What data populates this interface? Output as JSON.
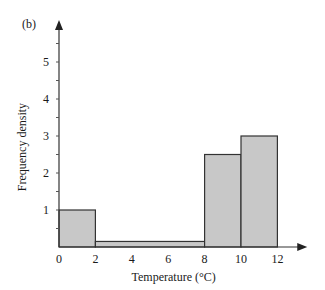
{
  "chart_data": {
    "type": "bar",
    "subtype": "histogram",
    "panel_label": "(b)",
    "title": "",
    "xlabel": "Temperature (°C)",
    "ylabel": "Frequency density",
    "xlim": [
      0,
      13
    ],
    "ylim": [
      0,
      6
    ],
    "x_ticks": [
      0,
      2,
      4,
      6,
      8,
      10,
      12
    ],
    "y_ticks": [
      1,
      2,
      3,
      4,
      5
    ],
    "bins": [
      {
        "from": 0,
        "to": 2,
        "value": 1
      },
      {
        "from": 2,
        "to": 8,
        "value": 0.15
      },
      {
        "from": 8,
        "to": 10,
        "value": 2.5
      },
      {
        "from": 10,
        "to": 12,
        "value": 3
      }
    ],
    "grid": false,
    "bar_color": "#c8c8c8",
    "edge_color": "#333333"
  }
}
